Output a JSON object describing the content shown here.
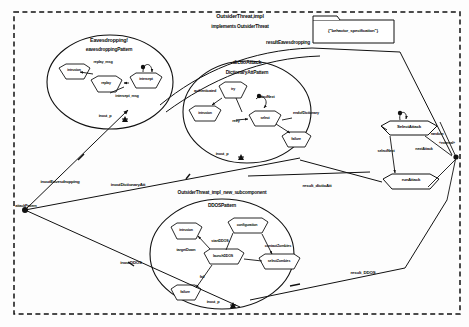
{
  "diagram": {
    "type": "uml-composite-structure",
    "frame_label": "OutsiderThreat,impl",
    "frame_subtitle": "implements OutsiderThreat",
    "note": "{\"behavior_specification\"}",
    "border_style": "dashed"
  },
  "components": {
    "eavesdropping": {
      "title": "Eavesdropping!",
      "pattern": "eavesdroppingPattern",
      "port": "inout_p",
      "states": [
        {
          "name": "intrusion"
        },
        {
          "name": "replay"
        },
        {
          "name": "intercept"
        }
      ],
      "transitions": [
        {
          "label": "replay_msg"
        },
        {
          "label": "intercept_msg"
        }
      ]
    },
    "dictioattack": {
      "title": "dictioAttack",
      "pattern": "DictionaryAttPattern",
      "port": "inout_p",
      "states": [
        {
          "name": "intrusion"
        },
        {
          "name": "try"
        },
        {
          "name": "select"
        },
        {
          "name": "failure"
        }
      ],
      "transitions": [
        {
          "label": "authenticated"
        },
        {
          "label": "selectNext"
        },
        {
          "label": "endofDictionary"
        },
        {
          "label": "retry"
        }
      ]
    },
    "ddos": {
      "title": "OutsiderThreat_impl_new_subcomponent",
      "pattern": "DDOSPattern",
      "port": "inout_p",
      "states": [
        {
          "name": "intrusion"
        },
        {
          "name": "configuration"
        },
        {
          "name": "launchDDOS"
        },
        {
          "name": "selectZombies"
        },
        {
          "name": "failure"
        }
      ],
      "transitions": [
        {
          "label": "startDDOS"
        },
        {
          "label": "targetDown"
        },
        {
          "label": "contactZombies"
        },
        {
          "label": "fail"
        }
      ]
    }
  },
  "right_block": {
    "select_attack": "SelectAttack",
    "run_attack": "runAttack",
    "select_next": "selectNext",
    "next_attack": "nextAttack",
    "random": "random",
    "external": "«external»"
  },
  "connectors": {
    "result_eavesdropping": "resultEavesdropping",
    "inout_eavesdropping": "inoutEavesdropping",
    "inout_dictionaryatt": "inoutDictionaryAtt",
    "inout_ddos": "inoutDDOS",
    "result_dictioatt": "result_dictioAtt",
    "result_ddos": "result_DDOS",
    "attack_pattern": "attackPattern"
  },
  "colors": {
    "stroke": "#111111",
    "background": "#fdfdfd",
    "text": "#0b0b0b"
  }
}
